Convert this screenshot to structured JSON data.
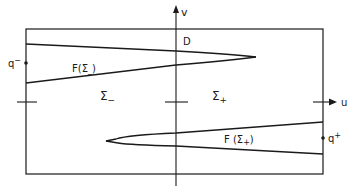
{
  "diagram": {
    "axes": {
      "vertical_label": "v",
      "horizontal_label": "u"
    },
    "domain_label": "D",
    "regions": {
      "left": {
        "symbol": "Σ",
        "subscript": "−"
      },
      "right": {
        "symbol": "Σ",
        "subscript": "+"
      }
    },
    "wedges": {
      "upper": {
        "label_prefix": "F(Σ",
        "label_sub": "_",
        "label_suffix": ")"
      },
      "lower": {
        "label_prefix": "F (Σ",
        "label_sub": "+",
        "label_suffix": ")"
      }
    },
    "points": {
      "left": {
        "base": "q",
        "sup": "−"
      },
      "right": {
        "base": "q",
        "sup": "+"
      }
    },
    "colors": {
      "line": "#1a1a1a",
      "background": "#ffffff"
    }
  }
}
